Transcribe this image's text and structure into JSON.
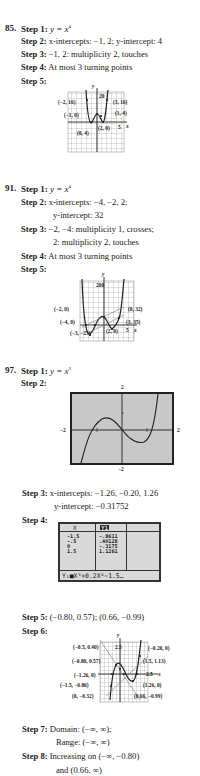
{
  "problems": [
    {
      "number": "85.",
      "steps": [
        {
          "label": "Step 1:",
          "text": "y = x",
          "sup": "4"
        },
        {
          "label": "Step 2:",
          "text": "x-intercepts: −1, 2; y-intercept: 4"
        },
        {
          "label": "Step 3:",
          "text": "−1, 2: multiplicity 2, touches"
        },
        {
          "label": "Step 4:",
          "text": "At most 3 turning points"
        },
        {
          "label": "Step 5:",
          "text": ""
        }
      ],
      "graph": {
        "y_axis_label": "y",
        "x_axis_label": "x",
        "y_tick": "20",
        "x_tick": "5",
        "points": [
          "(−2, 16)",
          "(3, 16)",
          "(−1, 0)",
          "(1, 4)",
          "(2, 0)",
          "(0, 4)"
        ]
      }
    },
    {
      "number": "91.",
      "steps": [
        {
          "label": "Step 1:",
          "text": "y = x",
          "sup": "4"
        },
        {
          "label": "Step 2:",
          "text": "x-intercepts: −4, −2, 2;",
          "text2": "y-intercept: 32"
        },
        {
          "label": "Step 3:",
          "text": "−2, −4: multiplicity 1, crosses;",
          "text2": "2: multiplicity 2, touches"
        },
        {
          "label": "Step 4:",
          "text": "At most 3 turning points"
        },
        {
          "label": "Step 5:",
          "text": ""
        }
      ],
      "graph": {
        "y_axis_label": "y",
        "x_axis_label": "x",
        "y_tick": "200",
        "x_tick": "5",
        "points": [
          "(−2, 0)",
          "(0, 32)",
          "(−4, 0)",
          "(3, 35)",
          "(−3, −25)",
          "(2, 0)"
        ]
      }
    },
    {
      "number": "97.",
      "steps": [
        {
          "label": "Step 1:",
          "text": "y = x",
          "sup": "3"
        },
        {
          "label": "Step 2:",
          "text": ""
        },
        {
          "label": "Step 3:",
          "text": "x-intercepts: −1.26, −0.20, 1.26",
          "text2": "y-intercept: −0.31752"
        },
        {
          "label": "Step 4:",
          "text": ""
        },
        {
          "label": "Step 5:",
          "text": "(−0.80, 0.57); (0.66, −0.99)"
        },
        {
          "label": "Step 6:",
          "text": ""
        },
        {
          "label": "Step 7:",
          "text": "Domain: (−∞, ∞);",
          "text2": "Range: (−∞, ∞)"
        },
        {
          "label": "Step 8:",
          "text": "Increasing on (−∞, −0.80)",
          "text2": "and (0.66, ∞)"
        }
      ],
      "calculator_window": {
        "top": "2",
        "bottom": "−2",
        "left": "−2",
        "right": "2"
      },
      "table": {
        "headers": [
          "X",
          "Y1"
        ],
        "rows": [
          [
            "-1.5",
            "-.8611"
          ],
          [
            "-.5",
            ".40128"
          ],
          [
            "0",
            "-.3175"
          ],
          [
            "1.5",
            "1.1261"
          ]
        ],
        "formula": "Y₁■X³+0.2X²−1.5…"
      },
      "graph": {
        "y_axis_label": "y",
        "x_axis_label": "x",
        "y_tick": "2.5",
        "x_tick": "2.5",
        "points": [
          "(−0.5, 0.40)",
          "(−0.20, 0)",
          "(−0.80, 0.57)",
          "(1.5, 1.13)",
          "(−1.26, 0)",
          "(−1.5, −0.86)",
          "(1.26, 0)",
          "(0, −0.32)",
          "(0.66, −0.99)"
        ]
      }
    }
  ]
}
